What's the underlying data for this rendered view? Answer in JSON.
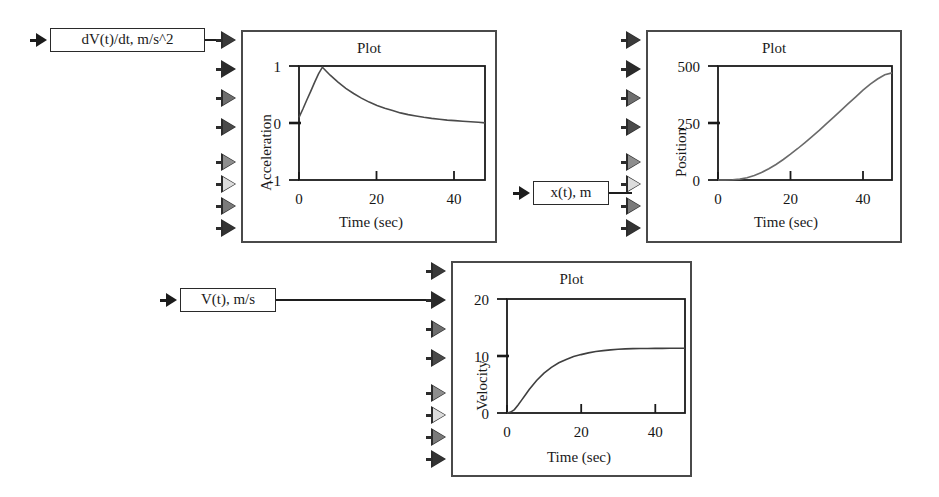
{
  "diagram": {
    "background": "#ffffff",
    "line_color": "#1e1e1e",
    "block_border_color": "#4a4a4a"
  },
  "signal_labels": [
    {
      "name": "acceleration-signal-label",
      "text": "dV(t)/dt, m/s^2"
    },
    {
      "name": "position-signal-label",
      "text": "x(t), m"
    },
    {
      "name": "velocity-signal-label",
      "text": "V(t), m/s"
    }
  ],
  "blocks": [
    {
      "id": "acceleration-plot-block",
      "title": "Plot",
      "port_count": 8,
      "connected_port_index": 0,
      "port_shades": [
        "#3a3a3a",
        "#2a2a2a",
        "#6e6e6e",
        "#4a4a4a",
        "#8e8e8e",
        "#dcdcdc",
        "#7a7a7a",
        "#333333"
      ]
    },
    {
      "id": "position-plot-block",
      "title": "Plot",
      "port_count": 8,
      "connected_port_index": 6,
      "port_shades": [
        "#3a3a3a",
        "#2a2a2a",
        "#6e6e6e",
        "#4a4a4a",
        "#8e8e8e",
        "#dcdcdc",
        "#7a7a7a",
        "#333333"
      ]
    },
    {
      "id": "velocity-plot-block",
      "title": "Plot",
      "port_count": 8,
      "connected_port_index": 1,
      "port_shades": [
        "#3a3a3a",
        "#2a2a2a",
        "#6e6e6e",
        "#4a4a4a",
        "#8e8e8e",
        "#dcdcdc",
        "#7a7a7a",
        "#333333"
      ]
    }
  ],
  "chart_data": [
    {
      "id": "acceleration",
      "type": "line",
      "title": "Plot",
      "xlabel": "Time (sec)",
      "ylabel": "Acceleration",
      "xlim": [
        0,
        48
      ],
      "ylim": [
        -1,
        1
      ],
      "xticks": [
        0,
        20,
        40
      ],
      "yticks": [
        -1,
        0,
        1
      ],
      "xticklabels": [
        "0",
        "20",
        "40"
      ],
      "yticklabels": [
        "-1",
        "0",
        "1"
      ],
      "grid": false,
      "legend": "none",
      "series": [
        {
          "name": "dV/dt",
          "x": [
            0,
            1,
            2,
            3,
            4,
            5,
            6,
            7,
            8,
            9,
            10,
            12,
            14,
            16,
            18,
            20,
            22,
            24,
            26,
            28,
            30,
            32,
            34,
            36,
            38,
            40,
            42,
            44,
            46,
            48
          ],
          "y": [
            0.1,
            0.25,
            0.41,
            0.56,
            0.72,
            0.88,
            1.0,
            0.93,
            0.86,
            0.8,
            0.74,
            0.63,
            0.54,
            0.46,
            0.39,
            0.33,
            0.28,
            0.24,
            0.2,
            0.17,
            0.145,
            0.12,
            0.1,
            0.085,
            0.07,
            0.06,
            0.05,
            0.04,
            0.03,
            0.02
          ]
        }
      ]
    },
    {
      "id": "position",
      "type": "line",
      "title": "Plot",
      "xlabel": "Time (sec)",
      "ylabel": "Position",
      "xlim": [
        0,
        48
      ],
      "ylim": [
        0,
        500
      ],
      "xticks": [
        0,
        20,
        40
      ],
      "yticks": [
        0,
        250,
        500
      ],
      "xticklabels": [
        "0",
        "20",
        "40"
      ],
      "yticklabels": [
        "0",
        "250",
        "500"
      ],
      "grid": false,
      "legend": "none",
      "series": [
        {
          "name": "x(t)",
          "x": [
            0,
            2,
            4,
            6,
            8,
            10,
            12,
            14,
            16,
            18,
            20,
            22,
            24,
            26,
            28,
            30,
            32,
            34,
            36,
            38,
            40,
            42,
            44,
            46,
            48
          ],
          "y": [
            0,
            0,
            1,
            4,
            10,
            20,
            33,
            49,
            68,
            90,
            113,
            138,
            164,
            191,
            219,
            248,
            277,
            306,
            336,
            365,
            394,
            420,
            443,
            462,
            470
          ]
        }
      ]
    },
    {
      "id": "velocity",
      "type": "line",
      "title": "Plot",
      "xlabel": "Time (sec)",
      "ylabel": "Velocity",
      "xlim": [
        0,
        48
      ],
      "ylim": [
        0,
        20
      ],
      "xticks": [
        0,
        20,
        40
      ],
      "yticks": [
        0,
        10,
        20
      ],
      "xticklabels": [
        "0",
        "20",
        "40"
      ],
      "yticklabels": [
        "0",
        "10",
        "20"
      ],
      "grid": false,
      "legend": "none",
      "series": [
        {
          "name": "V(t)",
          "x": [
            0,
            1,
            2,
            3,
            4,
            5,
            6,
            8,
            10,
            12,
            14,
            16,
            18,
            20,
            22,
            24,
            26,
            28,
            30,
            32,
            34,
            36,
            38,
            40,
            42,
            44,
            46,
            48
          ],
          "y": [
            0,
            0.15,
            0.6,
            1.4,
            2.3,
            3.2,
            4.1,
            5.7,
            7.0,
            8.0,
            8.8,
            9.4,
            9.9,
            10.25,
            10.55,
            10.8,
            10.95,
            11.08,
            11.18,
            11.25,
            11.3,
            11.32,
            11.33,
            11.34,
            11.34,
            11.35,
            11.35,
            11.35
          ]
        }
      ]
    }
  ]
}
